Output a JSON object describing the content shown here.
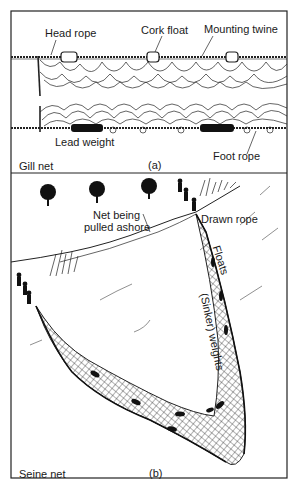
{
  "figure": {
    "panel_a": {
      "title": "Gill net",
      "caption": "(a)",
      "labels": {
        "head_rope": "Head rope",
        "cork_float": "Cork float",
        "mounting_twine": "Mounting twine",
        "lead_weight": "Lead weight",
        "foot_rope": "Foot rope"
      }
    },
    "panel_b": {
      "title": "Seine net",
      "caption": "(b)",
      "labels": {
        "net_being_pulled_1": "Net being",
        "net_being_pulled_2": "pulled ashore",
        "drawn_rope": "Drawn rope",
        "floats": "Floats",
        "sinker_weights": "(Sinker) weights"
      }
    }
  }
}
